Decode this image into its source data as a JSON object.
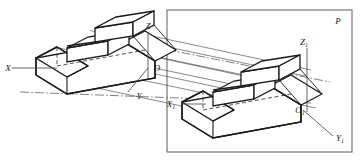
{
  "figure": {
    "background_color": "#ffffff",
    "line_color": "#1a1a1a",
    "ray_color": "#3a3a3a",
    "plane_border_color": "#6b6b6b",
    "labels": {
      "plane": "P",
      "axis_x": "X",
      "axis_y": "Y",
      "axis_z": "Z",
      "origin": "O",
      "axis_x1_base": "X",
      "axis_x1_sub": "1",
      "axis_y1_base": "Y",
      "axis_y1_sub": "1",
      "axis_z1_base": "Z",
      "axis_z1_sub": "1",
      "origin1_base": "O",
      "origin1_sub": "1"
    }
  }
}
